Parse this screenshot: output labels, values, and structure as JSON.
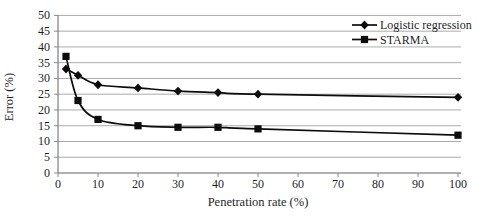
{
  "figure": {
    "background": "#ffffff"
  },
  "chart_data": {
    "type": "line",
    "title": "",
    "xlabel": "Penetration rate (%)",
    "ylabel": "Error (%)",
    "xlim": [
      0,
      100
    ],
    "ylim": [
      0,
      50
    ],
    "x_ticks": [
      0,
      10,
      20,
      30,
      40,
      50,
      60,
      70,
      80,
      90,
      100
    ],
    "y_ticks": [
      0,
      5,
      10,
      15,
      20,
      25,
      30,
      35,
      40,
      45,
      50
    ],
    "grid": "horizontal",
    "legend_position": "top-right-inside",
    "x": [
      2,
      5,
      10,
      20,
      30,
      40,
      50,
      100
    ],
    "series": [
      {
        "name": "Logistic regression",
        "marker": "diamond",
        "values": [
          33,
          31,
          28,
          27,
          26,
          25.5,
          25,
          24
        ]
      },
      {
        "name": "STARMA",
        "marker": "square",
        "values": [
          37,
          23,
          17,
          15,
          14.5,
          14.5,
          14,
          12
        ]
      }
    ],
    "colors": {
      "series_line": "#0c0c0c",
      "marker": "#0c0c0c",
      "gridline": "#ababab",
      "axis": "#636363",
      "tick": "#8a8a8a",
      "text": "#1f1f1f",
      "background": "#ffffff"
    }
  }
}
